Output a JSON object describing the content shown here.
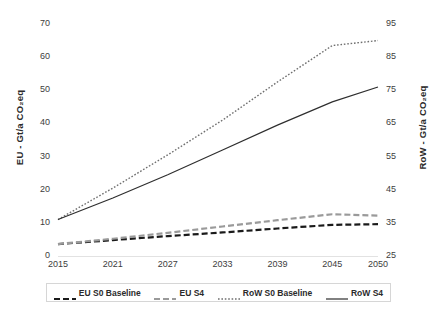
{
  "chart_data": {
    "type": "line",
    "title": "",
    "xlabel": "",
    "ylabel": "EU - Gt/a CO2eq",
    "y2label": "RoW - Gt/a CO2eq",
    "grid": false,
    "legend_position": "bottom",
    "x": [
      2015,
      2021,
      2027,
      2033,
      2039,
      2045,
      2050
    ],
    "xlim": [
      2015,
      2050
    ],
    "xticklabels": [
      "2015",
      "2021",
      "2027",
      "2033",
      "2039",
      "2045",
      "2050"
    ],
    "ylim": [
      0,
      70
    ],
    "yticklabels": [
      "0",
      "10",
      "20",
      "30",
      "40",
      "50",
      "60",
      "70"
    ],
    "yticks": [
      0,
      10,
      20,
      30,
      40,
      50,
      60,
      70
    ],
    "y2lim": [
      25,
      95
    ],
    "y2ticklabels": [
      "25",
      "35",
      "45",
      "55",
      "65",
      "75",
      "85",
      "95"
    ],
    "y2ticks": [
      25,
      35,
      45,
      55,
      65,
      75,
      85,
      95
    ],
    "series": [
      {
        "name": "EU S0 Baseline",
        "axis": "left",
        "style": "dashed",
        "color": "#1a1a1a",
        "values": [
          3.6,
          4.8,
          6.0,
          7.1,
          8.3,
          9.4,
          9.6
        ]
      },
      {
        "name": "EU S4",
        "axis": "left",
        "style": "dashed",
        "color": "#9a9a9a",
        "values": [
          3.6,
          5.2,
          7.0,
          8.9,
          10.8,
          12.6,
          12.2
        ]
      },
      {
        "name": "RoW S0 Baseline",
        "axis": "right",
        "style": "dotted",
        "color": "#6f6f6f",
        "values": [
          36.0,
          45.5,
          55.5,
          66.0,
          77.5,
          88.5,
          90.0
        ]
      },
      {
        "name": "RoW S4",
        "axis": "right",
        "style": "solid",
        "color": "#2e2e2e",
        "values": [
          36.0,
          42.5,
          49.5,
          57.0,
          64.5,
          71.5,
          76.0
        ]
      }
    ]
  },
  "axes": {
    "left_title": "EU - Gt/a CO₂eq",
    "right_title": "RoW - Gt/a CO₂eq"
  },
  "legend": {
    "items": [
      {
        "label": "EU S0 Baseline",
        "style": "dashed",
        "color": "#1a1a1a"
      },
      {
        "label": "EU S4",
        "style": "dashed",
        "color": "#9a9a9a"
      },
      {
        "label": "RoW S0 Baseline",
        "style": "dotted",
        "color": "#6f6f6f"
      },
      {
        "label": "RoW S4",
        "style": "solid",
        "color": "#2e2e2e"
      }
    ]
  }
}
